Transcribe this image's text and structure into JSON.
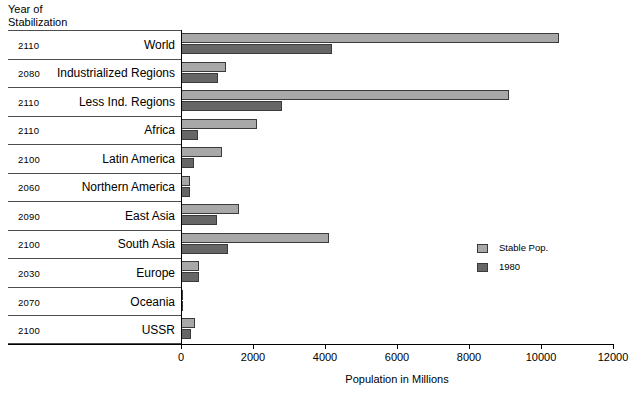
{
  "header": {
    "corner_label": "Year of\nStabilization"
  },
  "legend": {
    "items": [
      {
        "label": "Stable Pop.",
        "color": "#a8a8a8"
      },
      {
        "label": "1980",
        "color": "#666666"
      }
    ]
  },
  "axis": {
    "x_label": "Population in Millions",
    "ticks": [
      "0",
      "2000",
      "4000",
      "6000",
      "8000",
      "10000",
      "12000"
    ]
  },
  "columns": {
    "year_header": "Year of Stabilization",
    "category_header": ""
  },
  "rows": [
    {
      "year": "2110",
      "category": "World"
    },
    {
      "year": "2080",
      "category": "Industrialized Regions"
    },
    {
      "year": "2110",
      "category": "Less Ind. Regions"
    },
    {
      "year": "2110",
      "category": "Africa"
    },
    {
      "year": "2100",
      "category": "Latin America"
    },
    {
      "year": "2060",
      "category": "Northern America"
    },
    {
      "year": "2090",
      "category": "East Asia"
    },
    {
      "year": "2100",
      "category": "South Asia"
    },
    {
      "year": "2030",
      "category": "Europe"
    },
    {
      "year": "2070",
      "category": "Oceania"
    },
    {
      "year": "2100",
      "category": "USSR"
    }
  ],
  "chart_data": {
    "type": "bar",
    "orientation": "horizontal",
    "title": "",
    "xlabel": "Population in Millions",
    "ylabel": "",
    "xlim": [
      0,
      12000
    ],
    "xticks": [
      0,
      2000,
      4000,
      6000,
      8000,
      10000,
      12000
    ],
    "grid": false,
    "legend_position": "right-middle",
    "categories": [
      "World",
      "Industrialized Regions",
      "Less Ind. Regions",
      "Africa",
      "Latin America",
      "Northern America",
      "East Asia",
      "South Asia",
      "Europe",
      "Oceania",
      "USSR"
    ],
    "year_of_stabilization": [
      2110,
      2080,
      2110,
      2110,
      2100,
      2060,
      2090,
      2100,
      2030,
      2070,
      2100
    ],
    "series": [
      {
        "name": "Stable Pop.",
        "color": "#a8a8a8",
        "values": [
          10500,
          1250,
          9100,
          2100,
          1150,
          250,
          1600,
          4100,
          500,
          40,
          390
        ]
      },
      {
        "name": "1980",
        "color": "#666666",
        "values": [
          4200,
          1030,
          2800,
          480,
          360,
          250,
          1000,
          1300,
          490,
          25,
          265
        ]
      }
    ]
  }
}
